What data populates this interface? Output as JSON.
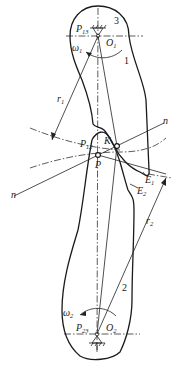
{
  "diagram": {
    "type": "cam-mechanism-instant-centers",
    "labels": {
      "p13": {
        "main": "P",
        "sub": "13"
      },
      "link3": "3",
      "omega1": {
        "main": "ω",
        "sub": "1"
      },
      "o1": {
        "main": "O",
        "sub": "1"
      },
      "link1": "1",
      "r1": {
        "main": "r",
        "sub": "1"
      },
      "n_right": "n",
      "n_left": "n",
      "p12": {
        "main": "P",
        "sub": "12"
      },
      "k": "K",
      "p": "P",
      "e1": {
        "main": "E",
        "sub": "1"
      },
      "e2": {
        "main": "E",
        "sub": "2"
      },
      "r2": {
        "main": "r",
        "sub": "2"
      },
      "link2": "2",
      "omega2": {
        "main": "ω",
        "sub": "2"
      },
      "p23": {
        "main": "P",
        "sub": "23"
      },
      "o2": {
        "main": "O",
        "sub": "2"
      }
    },
    "points": {
      "O1": [
        98,
        30
      ],
      "O2": [
        97,
        334
      ],
      "P": [
        98,
        155
      ],
      "K": [
        117,
        146
      ]
    },
    "stroke_color": "#1a1a1a",
    "background": "#ffffff"
  }
}
